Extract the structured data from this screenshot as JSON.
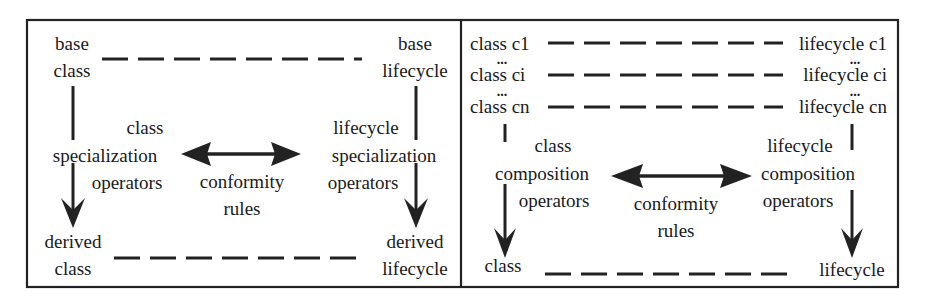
{
  "left_panel": {
    "base_class": [
      "base",
      "class"
    ],
    "base_lifecycle": [
      "base",
      "lifecycle"
    ],
    "class_ops": [
      "class",
      "specialization",
      "operators"
    ],
    "lifecycle_ops": [
      "lifecycle",
      "specialization",
      "operators"
    ],
    "conformity": [
      "conformity",
      "rules"
    ],
    "derived_class": [
      "derived",
      "class"
    ],
    "derived_lifecycle": [
      "derived",
      "lifecycle"
    ]
  },
  "right_panel": {
    "classes": [
      "class c1",
      "class ci",
      "class cn"
    ],
    "lifecycles": [
      "lifecycle c1",
      "lifecycle ci",
      "lifecycle cn"
    ],
    "ellipsis": "...",
    "class_ops": [
      "class",
      "composition",
      "operators"
    ],
    "lifecycle_ops": [
      "lifecycle",
      "composition",
      "operators"
    ],
    "conformity": [
      "conformity",
      "rules"
    ],
    "result_class": "class",
    "result_lifecycle": "lifecycle"
  }
}
